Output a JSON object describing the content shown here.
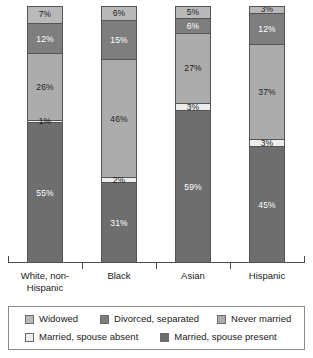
{
  "chart_data": {
    "type": "bar",
    "title": "",
    "subtitle": "",
    "xlabel": "",
    "ylabel": "",
    "ylim": [
      0,
      100
    ],
    "grid": false,
    "stacked": true,
    "stack_order": "bottom-to-top",
    "units": "percent",
    "legend_position": "bottom",
    "categories": [
      "White, non-Hispanic",
      "Black",
      "Asian",
      "Hispanic"
    ],
    "series": [
      {
        "name": "Married, spouse present",
        "color": "#6e6e6e",
        "values": [
          55,
          31,
          59,
          45
        ],
        "labels": [
          "55%",
          "31%",
          "59%",
          "45%"
        ]
      },
      {
        "name": "Married, spouse absent",
        "color": "#ededed",
        "values": [
          1,
          2,
          3,
          3
        ],
        "labels": [
          "1%",
          "2%",
          "3%",
          "3%"
        ]
      },
      {
        "name": "Never married",
        "color": "#acacac",
        "values": [
          26,
          46,
          27,
          37
        ],
        "labels": [
          "26%",
          "46%",
          "27%",
          "37%"
        ]
      },
      {
        "name": "Divorced, separated",
        "color": "#7e7e7e",
        "values": [
          12,
          15,
          6,
          12
        ],
        "labels": [
          "12%",
          "15%",
          "6%",
          "12%"
        ]
      },
      {
        "name": "Widowed",
        "color": "#b9b9b9",
        "values": [
          7,
          6,
          5,
          3
        ],
        "labels": [
          "7%",
          "6%",
          "5%",
          "3%"
        ]
      }
    ]
  },
  "axis": {
    "category_labels": [
      {
        "line1": "White, non-",
        "line2": "Hispanic"
      },
      {
        "line1": "Black",
        "line2": ""
      },
      {
        "line1": "Asian",
        "line2": ""
      },
      {
        "line1": "Hispanic",
        "line2": ""
      }
    ]
  },
  "legend": {
    "row1": [
      {
        "label": "Widowed",
        "color": "#b9b9b9"
      },
      {
        "label": "Divorced, separated",
        "color": "#7e7e7e"
      },
      {
        "label": "Never married",
        "color": "#acacac"
      }
    ],
    "row2": [
      {
        "label": "Married, spouse absent",
        "color": "#ededed"
      },
      {
        "label": "Married, spouse present",
        "color": "#6e6e6e"
      }
    ]
  }
}
